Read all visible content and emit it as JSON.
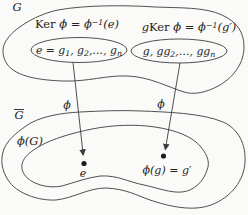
{
  "colors": {
    "background": "#fafaf9",
    "ink": "#3c3c3c",
    "text": "#222222"
  },
  "top_group": {
    "label": "G",
    "kernel_oval": {
      "title_fn": "Ker ",
      "title_mid": "ϕ = ϕ",
      "title_sup": "−1",
      "title_arg": "(e)",
      "elements": {
        "p1": "e = g",
        "s1": "1",
        "p2": ", g",
        "s2": "2",
        "p3": ",…, g",
        "s3": "n"
      }
    },
    "coset_oval": {
      "title_g": "g",
      "title_fn": "Ker ",
      "title_mid": "ϕ = ϕ",
      "title_sup": "−1",
      "title_arg": "(g′)",
      "elements": {
        "p1": "g, gg",
        "s1": "2",
        "p2": ",…, gg",
        "s2": "n"
      }
    }
  },
  "maps": {
    "left_label": "ϕ",
    "right_label": "ϕ"
  },
  "bottom_group": {
    "label": "G",
    "image_label": "ϕ(G)",
    "identity_point_label": "e",
    "mapped_point_label": "ϕ(g) = g′"
  }
}
